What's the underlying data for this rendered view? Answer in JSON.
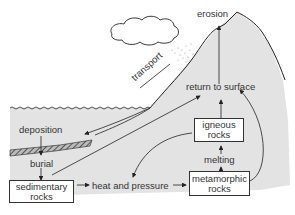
{
  "diagram": {
    "labels": {
      "erosion": "erosion",
      "transport": "transport",
      "return_to_surface": "return to surface",
      "deposition": "deposition",
      "burial": "burial",
      "heat_and_pressure": "heat and pressure",
      "melting": "melting"
    },
    "boxes": {
      "sedimentary": {
        "line1": "sedimentary",
        "line2": "rocks"
      },
      "igneous": {
        "line1": "igneous",
        "line2": "rocks"
      },
      "metamorphic": {
        "line1": "metamorphic",
        "line2": "rocks"
      }
    },
    "colors": {
      "ground": "#e3e3e3",
      "line": "#222222",
      "box_fill": "#ffffff"
    }
  }
}
